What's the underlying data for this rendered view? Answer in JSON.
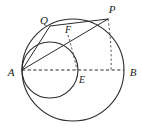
{
  "figure": {
    "background_color": "#ffffff",
    "stroke_color": "#2b2b2b",
    "labels": {
      "A": "A",
      "B": "B",
      "P": "P",
      "Q": "Q",
      "E": "E",
      "F": "F"
    },
    "points": [
      {
        "name": "A",
        "label": "A",
        "x": 22,
        "y": 70,
        "label_x": 11,
        "label_y": 73
      },
      {
        "name": "B",
        "label": "B",
        "x": 124,
        "y": 70,
        "label_x": 132,
        "label_y": 73
      },
      {
        "name": "E",
        "label": "E",
        "x": 78,
        "y": 70,
        "label_x": 80,
        "label_y": 80
      },
      {
        "name": "P",
        "label": "P",
        "x": 108,
        "y": 19,
        "label_x": 110,
        "label_y": 9
      },
      {
        "name": "Q",
        "label": "Q",
        "x": 50,
        "y": 26,
        "label_x": 44,
        "label_y": 21
      },
      {
        "name": "F",
        "label": "F",
        "x": 68,
        "y": 35,
        "label_x": 67,
        "label_y": 31
      }
    ],
    "circles": [
      {
        "name": "large-circle",
        "cx": 73,
        "cy": 70,
        "r": 51,
        "diameter_endpoints": [
          "A",
          "B"
        ]
      },
      {
        "name": "medium-circle",
        "cx": 50,
        "cy": 70,
        "r": 28,
        "diameter_endpoints": [
          "A",
          "E"
        ]
      }
    ],
    "segments": [
      {
        "name": "segment-AP",
        "from": "A",
        "to": "P",
        "style": "solid"
      },
      {
        "name": "segment-AQ",
        "from": "A",
        "to": "Q",
        "style": "solid"
      },
      {
        "name": "segment-QP",
        "from": "Q",
        "to": "P",
        "style": "solid"
      },
      {
        "name": "segment-AB",
        "from": "A",
        "to": "B",
        "style": "dashed"
      },
      {
        "name": "segment-P-foot",
        "from": "P",
        "to": "foot-of-P",
        "style": "dashed"
      },
      {
        "name": "segment-F-E",
        "from": "F",
        "to": "E",
        "style": "dashed"
      }
    ]
  }
}
